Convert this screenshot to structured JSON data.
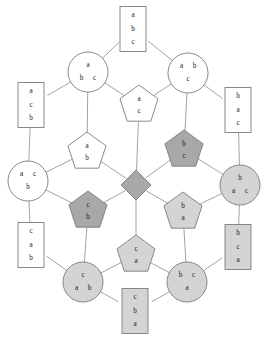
{
  "diagram": {
    "colors": {
      "background": "#ffffff",
      "edge": "#8a8a8a",
      "stroke": "#7d7d7d",
      "fill_white": "#ffffff",
      "fill_light_gray": "#d4d4d4",
      "fill_dark_gray": "#a8a8a8",
      "text": "#1a1a1a"
    },
    "nodes": [
      {
        "id": "n1",
        "shape": "rectangle",
        "fill": "white",
        "x": 133,
        "y": 29,
        "w": 26,
        "h": 45,
        "layout": "vertical",
        "labels": [
          "a",
          "b",
          "c"
        ]
      },
      {
        "id": "n2",
        "shape": "circle",
        "fill": "white",
        "x": 88,
        "y": 72,
        "r": 20,
        "layout": "one-over-two",
        "labels": [
          "a",
          "b",
          "c"
        ]
      },
      {
        "id": "n3",
        "shape": "circle",
        "fill": "white",
        "x": 188,
        "y": 73,
        "r": 20,
        "layout": "two-over-one",
        "labels": [
          "a",
          "b",
          "c"
        ]
      },
      {
        "id": "n4",
        "shape": "rectangle",
        "fill": "white",
        "x": 31,
        "y": 105,
        "w": 26,
        "h": 45,
        "layout": "vertical",
        "labels": [
          "a",
          "c",
          "b"
        ]
      },
      {
        "id": "n5",
        "shape": "pentagon",
        "fill": "white",
        "x": 139,
        "y": 105,
        "r": 20,
        "layout": "one-over-one",
        "labels": [
          "a",
          "c"
        ]
      },
      {
        "id": "n6",
        "shape": "rectangle",
        "fill": "white",
        "x": 238,
        "y": 110,
        "w": 26,
        "h": 45,
        "layout": "vertical",
        "labels": [
          "b",
          "a",
          "c"
        ]
      },
      {
        "id": "n7",
        "shape": "pentagon",
        "fill": "white",
        "x": 87,
        "y": 152,
        "r": 20,
        "layout": "one-over-one",
        "labels": [
          "a",
          "b"
        ]
      },
      {
        "id": "n8",
        "shape": "pentagon",
        "fill": "dark",
        "x": 184,
        "y": 150,
        "r": 20,
        "layout": "one-over-one",
        "labels": [
          "b",
          "c"
        ]
      },
      {
        "id": "n9",
        "shape": "circle",
        "fill": "white",
        "x": 28,
        "y": 181,
        "r": 20,
        "layout": "two-over-one",
        "labels": [
          "a",
          "c",
          "b"
        ]
      },
      {
        "id": "n10",
        "shape": "diamond",
        "fill": "dark",
        "x": 136,
        "y": 185,
        "r": 15,
        "layout": "none",
        "labels": []
      },
      {
        "id": "n11",
        "shape": "circle",
        "fill": "light",
        "x": 240,
        "y": 185,
        "r": 20,
        "layout": "one-over-two",
        "labels": [
          "b",
          "a",
          "c"
        ]
      },
      {
        "id": "n12",
        "shape": "pentagon",
        "fill": "dark",
        "x": 88,
        "y": 211,
        "r": 20,
        "layout": "one-over-one",
        "labels": [
          "c",
          "b"
        ]
      },
      {
        "id": "n13",
        "shape": "pentagon",
        "fill": "light",
        "x": 183,
        "y": 212,
        "r": 20,
        "layout": "one-over-one",
        "labels": [
          "b",
          "a"
        ]
      },
      {
        "id": "n14",
        "shape": "rectangle",
        "fill": "white",
        "x": 31,
        "y": 245,
        "w": 26,
        "h": 45,
        "layout": "vertical",
        "labels": [
          "c",
          "a",
          "b"
        ]
      },
      {
        "id": "n15",
        "shape": "pentagon",
        "fill": "light",
        "x": 136,
        "y": 255,
        "r": 20,
        "layout": "one-over-one",
        "labels": [
          "c",
          "a"
        ]
      },
      {
        "id": "n16",
        "shape": "rectangle",
        "fill": "light",
        "x": 238,
        "y": 247,
        "w": 26,
        "h": 45,
        "layout": "vertical",
        "labels": [
          "b",
          "c",
          "a"
        ]
      },
      {
        "id": "n17",
        "shape": "circle",
        "fill": "light",
        "x": 83,
        "y": 282,
        "r": 20,
        "layout": "one-over-two",
        "labels": [
          "c",
          "a",
          "b"
        ]
      },
      {
        "id": "n18",
        "shape": "circle",
        "fill": "light",
        "x": 187,
        "y": 282,
        "r": 20,
        "layout": "two-over-one",
        "labels": [
          "b",
          "c",
          "a"
        ]
      },
      {
        "id": "n19",
        "shape": "rectangle",
        "fill": "light",
        "x": 135,
        "y": 311,
        "w": 26,
        "h": 45,
        "layout": "vertical",
        "labels": [
          "c",
          "b",
          "a"
        ]
      }
    ],
    "edges": [
      {
        "from": "n1",
        "to": "n2"
      },
      {
        "from": "n1",
        "to": "n3"
      },
      {
        "from": "n2",
        "to": "n4"
      },
      {
        "from": "n2",
        "to": "n5"
      },
      {
        "from": "n2",
        "to": "n7"
      },
      {
        "from": "n3",
        "to": "n5"
      },
      {
        "from": "n3",
        "to": "n6"
      },
      {
        "from": "n3",
        "to": "n8"
      },
      {
        "from": "n4",
        "to": "n9"
      },
      {
        "from": "n5",
        "to": "n10"
      },
      {
        "from": "n6",
        "to": "n11"
      },
      {
        "from": "n7",
        "to": "n9"
      },
      {
        "from": "n7",
        "to": "n10"
      },
      {
        "from": "n8",
        "to": "n10"
      },
      {
        "from": "n8",
        "to": "n11"
      },
      {
        "from": "n9",
        "to": "n12"
      },
      {
        "from": "n9",
        "to": "n14"
      },
      {
        "from": "n10",
        "to": "n12"
      },
      {
        "from": "n10",
        "to": "n13"
      },
      {
        "from": "n10",
        "to": "n15"
      },
      {
        "from": "n11",
        "to": "n13"
      },
      {
        "from": "n11",
        "to": "n16"
      },
      {
        "from": "n12",
        "to": "n17"
      },
      {
        "from": "n13",
        "to": "n18"
      },
      {
        "from": "n14",
        "to": "n17"
      },
      {
        "from": "n15",
        "to": "n17"
      },
      {
        "from": "n15",
        "to": "n18"
      },
      {
        "from": "n16",
        "to": "n18"
      },
      {
        "from": "n17",
        "to": "n19"
      },
      {
        "from": "n18",
        "to": "n19"
      }
    ]
  }
}
